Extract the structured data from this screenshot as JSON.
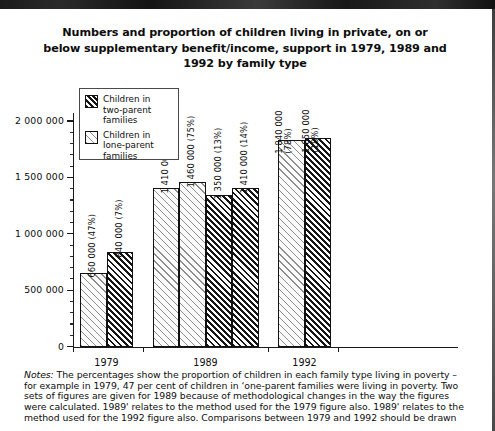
{
  "title": {
    "line1": "Numbers and proportion of children living in private, on or",
    "line2": "below supplementary benefit/income, support in 1979, 1989 and",
    "line3": "1992 by family type"
  },
  "legend": {
    "items": [
      {
        "label_line1": "Children in",
        "label_line2": "two-parent",
        "label_line3": "families",
        "pattern": "dense-hatch"
      },
      {
        "label_line1": "Children in",
        "label_line2": "lone-parent",
        "label_line3": "families",
        "pattern": "sparse-hatch"
      }
    ]
  },
  "axis": {
    "y_ticks": [
      "2 000 000",
      "1 500 000",
      "1 000 000",
      "500 000",
      "0"
    ],
    "y_tick_values": [
      2000000,
      1500000,
      1000000,
      500000,
      0
    ],
    "x_labels": [
      "1979",
      "1989",
      "1992"
    ]
  },
  "notes": {
    "label": "Notes:",
    "body": " The percentages show the proportion of children in each family type living in poverty – for example in 1979, 47 per cent of children in ‘one-parent families were living in poverty. Two sets of figures are given for 1989 because of methodological changes in the way the figures were calculated. 1989' relates to the method used for the 1979 figure also. 1989' relates to the method used for the 1992 figure also. Comparisons between 1979 and 1992 should be drawn"
  },
  "chart_data": {
    "type": "bar",
    "title": "Numbers and proportion of children living in private, on or below supplementary benefit/income, support in 1979, 1989 and 1992 by family type",
    "xlabel": "",
    "ylabel": "",
    "ylim": [
      0,
      2000000
    ],
    "ytick_step": 500000,
    "minor_ticks": true,
    "grid": false,
    "legend_position": "upper-left-inside",
    "categories": [
      "1979",
      "1989",
      "1992"
    ],
    "bars": [
      {
        "group": "1979",
        "series": "Children in lone-parent families",
        "value": 660000,
        "percent": 47,
        "label": "660 000 (47%)",
        "pattern": "sparse-hatch"
      },
      {
        "group": "1979",
        "series": "Children in two-parent families",
        "value": 840000,
        "percent": 7,
        "label": "840 000 (7%)",
        "pattern": "dense-hatch"
      },
      {
        "group": "1989",
        "series": "Children in lone-parent families",
        "value": 1410000,
        "percent": 76,
        "label": "1 410 000 (76%)",
        "pattern": "sparse-hatch"
      },
      {
        "group": "1989",
        "series": "Children in lone-parent families",
        "value": 1460000,
        "percent": 75,
        "label": "1 460 000 (75%)",
        "pattern": "sparse-hatch"
      },
      {
        "group": "1989",
        "series": "Children in two-parent families",
        "value": 1350000,
        "percent": 13,
        "label": "1 350 000 (13%)",
        "pattern": "dense-hatch"
      },
      {
        "group": "1989",
        "series": "Children in two-parent families",
        "value": 1410000,
        "percent": 14,
        "label": "1 410 000 (14%)",
        "pattern": "dense-hatch"
      },
      {
        "group": "1992",
        "series": "Children in lone-parent families",
        "value": 1840000,
        "percent": 78,
        "label": "1 840 000",
        "label2": "(78%)",
        "pattern": "sparse-hatch"
      },
      {
        "group": "1992",
        "series": "Children in two-parent families",
        "value": 1850000,
        "percent": 18,
        "label": "1 850 000",
        "label2": "(18%)",
        "pattern": "dense-hatch"
      }
    ]
  }
}
